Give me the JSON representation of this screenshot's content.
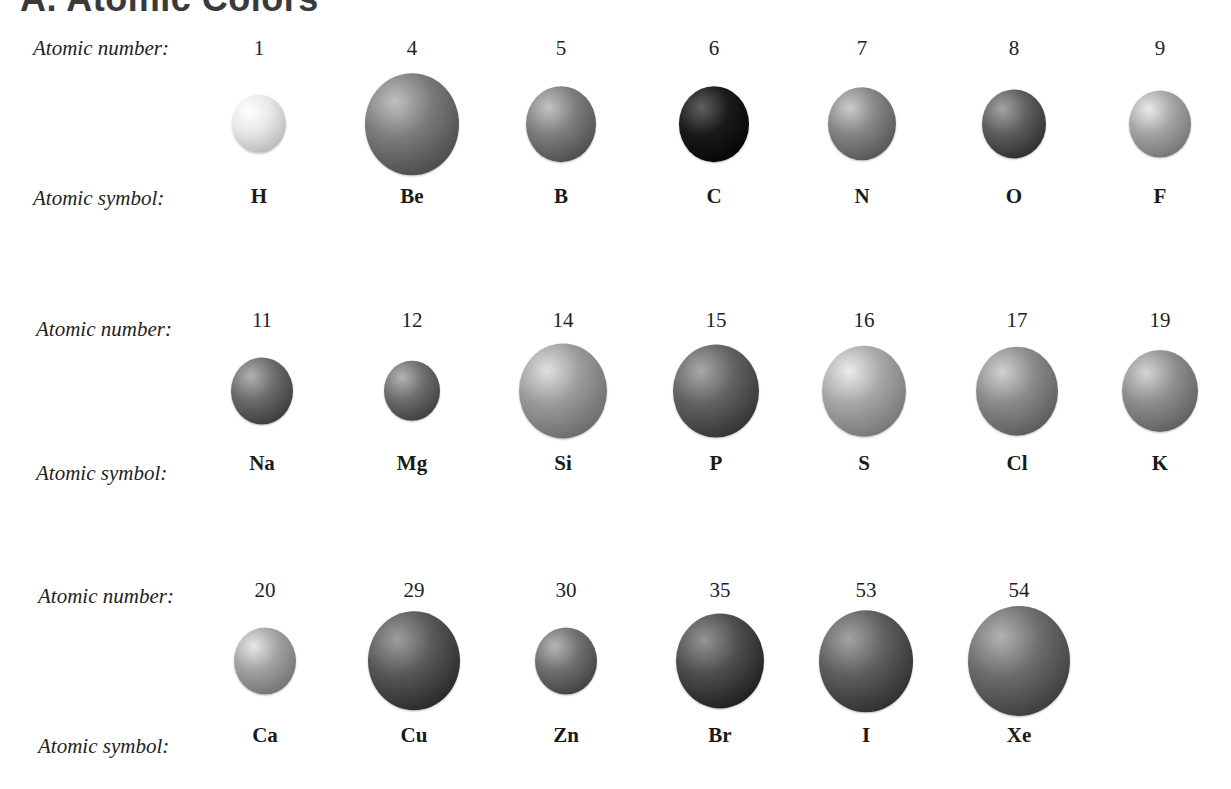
{
  "title": "A. Atomic Colors",
  "labels": {
    "atomic_number": "Atomic number:",
    "atomic_symbol": "Atomic symbol:"
  },
  "rows": [
    {
      "label_x": 33,
      "number_y": 36,
      "sphere_y": 124,
      "symbol_y": 184,
      "label_num_y": 36,
      "label_sym_y": 186,
      "atoms": [
        {
          "number": "1",
          "symbol": "H",
          "cx": 259,
          "r": 27,
          "color": "#e8e8e8"
        },
        {
          "number": "4",
          "symbol": "Be",
          "cx": 412,
          "r": 47,
          "color": "#7a7a7a"
        },
        {
          "number": "5",
          "symbol": "B",
          "cx": 561,
          "r": 35,
          "color": "#7d7d7d"
        },
        {
          "number": "6",
          "symbol": "C",
          "cx": 714,
          "r": 35,
          "color": "#1a1a1a"
        },
        {
          "number": "7",
          "symbol": "N",
          "cx": 862,
          "r": 34,
          "color": "#858585"
        },
        {
          "number": "8",
          "symbol": "O",
          "cx": 1014,
          "r": 32,
          "color": "#5e5e5e"
        },
        {
          "number": "9",
          "symbol": "F",
          "cx": 1160,
          "r": 31,
          "color": "#a4a4a4"
        }
      ]
    },
    {
      "label_x": 36,
      "number_y": 308,
      "sphere_y": 391,
      "symbol_y": 451,
      "label_num_y": 317,
      "label_sym_y": 461,
      "atoms": [
        {
          "number": "11",
          "symbol": "Na",
          "cx": 262,
          "r": 31,
          "color": "#6b6b6b"
        },
        {
          "number": "12",
          "symbol": "Mg",
          "cx": 412,
          "r": 28,
          "color": "#6e6e6e"
        },
        {
          "number": "14",
          "symbol": "Si",
          "cx": 563,
          "r": 44,
          "color": "#9a9a9a"
        },
        {
          "number": "15",
          "symbol": "P",
          "cx": 716,
          "r": 43,
          "color": "#626262"
        },
        {
          "number": "16",
          "symbol": "S",
          "cx": 864,
          "r": 42,
          "color": "#a6a6a6"
        },
        {
          "number": "17",
          "symbol": "Cl",
          "cx": 1017,
          "r": 41,
          "color": "#8a8a8a"
        },
        {
          "number": "19",
          "symbol": "K",
          "cx": 1160,
          "r": 38,
          "color": "#8e8e8e"
        }
      ]
    },
    {
      "label_x": 38,
      "number_y": 578,
      "sphere_y": 661,
      "symbol_y": 723,
      "label_num_y": 584,
      "label_sym_y": 734,
      "atoms": [
        {
          "number": "20",
          "symbol": "Ca",
          "cx": 265,
          "r": 31,
          "color": "#a2a2a2"
        },
        {
          "number": "29",
          "symbol": "Cu",
          "cx": 414,
          "r": 46,
          "color": "#585858"
        },
        {
          "number": "30",
          "symbol": "Zn",
          "cx": 566,
          "r": 31,
          "color": "#707070"
        },
        {
          "number": "35",
          "symbol": "Br",
          "cx": 720,
          "r": 44,
          "color": "#4e4e4e"
        },
        {
          "number": "53",
          "symbol": "I",
          "cx": 866,
          "r": 47,
          "color": "#5e5e5e"
        },
        {
          "number": "54",
          "symbol": "Xe",
          "cx": 1019,
          "r": 51,
          "color": "#6c6c6c"
        }
      ]
    }
  ]
}
